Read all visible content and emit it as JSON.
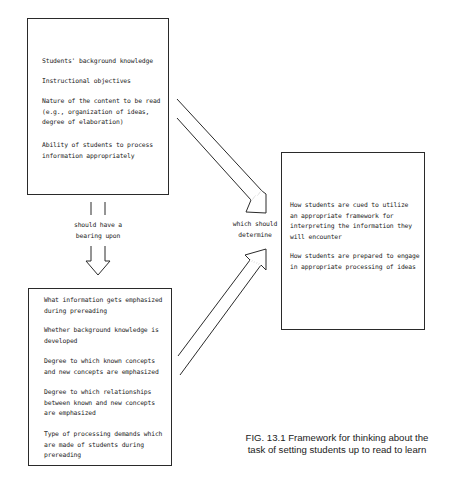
{
  "diagram": {
    "top_box": {
      "items": [
        "Students' background knowledge",
        "Instructional objectives",
        "Nature of the content to be read\n(e.g., organization of ideas,\ndegree of elaboration)",
        "Ability of students to process\ninformation appropriately"
      ]
    },
    "bottom_box": {
      "items": [
        "What information gets emphasized\nduring prereading",
        "Whether background knowledge is\ndeveloped",
        "Degree to which known concepts\nand new concepts are emphasized",
        "Degree to which relationships\nbetween known and new concepts\nare emphasized",
        "Type of processing demands which\nare made of students during\nprereading"
      ]
    },
    "right_box": {
      "items": [
        "How students are cued to utilize\nan appropriate framework for\ninterpreting the information they\nwill encounter",
        "How students are prepared to engage\nin appropriate processing of ideas"
      ]
    },
    "connectors": {
      "down_label": "should have a\nbearing upon",
      "right_label": "which should\ndetermine"
    },
    "caption": "FIG. 13.1 Framework for thinking about the\ntask of setting students up to read to learn"
  }
}
